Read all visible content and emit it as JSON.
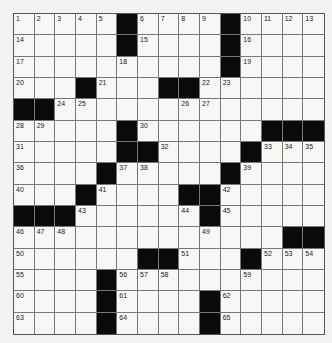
{
  "puzzle": {
    "rows": 15,
    "cols": 15,
    "grid": [
      "#####B######B####",
      ""
    ],
    "layout": [
      ".....#....#....",
      ".....#....#....",
      "..........#....",
      "...#...##......",
      "##.............",
      ".....#......###",
      ".....##....#...",
      "....#.....#....",
      "...#....##.....",
      "###......#.....",
      ".............##",
      "......##...#...",
      "....#..........",
      "....#....#.....",
      "....#....#....."
    ],
    "numbers": [
      [
        1,
        2,
        3,
        4,
        5,
        0,
        6,
        7,
        8,
        9,
        0,
        10,
        11,
        12,
        13
      ],
      [
        14,
        0,
        0,
        0,
        0,
        0,
        15,
        0,
        0,
        0,
        0,
        16,
        0,
        0,
        0
      ],
      [
        17,
        0,
        0,
        0,
        0,
        18,
        0,
        0,
        0,
        0,
        0,
        19,
        0,
        0,
        0
      ],
      [
        20,
        0,
        0,
        0,
        21,
        0,
        0,
        0,
        0,
        22,
        23,
        0,
        0,
        0,
        0
      ],
      [
        0,
        0,
        24,
        25,
        0,
        0,
        0,
        0,
        26,
        27,
        0,
        0,
        0,
        0,
        0
      ],
      [
        28,
        29,
        0,
        0,
        0,
        0,
        30,
        0,
        0,
        0,
        0,
        0,
        0,
        0,
        0
      ],
      [
        31,
        0,
        0,
        0,
        0,
        0,
        0,
        32,
        0,
        0,
        0,
        0,
        33,
        34,
        35
      ],
      [
        36,
        0,
        0,
        0,
        0,
        37,
        38,
        0,
        0,
        0,
        0,
        39,
        0,
        0,
        0
      ],
      [
        40,
        0,
        0,
        0,
        41,
        0,
        0,
        0,
        0,
        0,
        42,
        0,
        0,
        0,
        0
      ],
      [
        0,
        0,
        0,
        43,
        0,
        0,
        0,
        0,
        44,
        0,
        45,
        0,
        0,
        0,
        0
      ],
      [
        46,
        47,
        48,
        0,
        0,
        0,
        0,
        0,
        0,
        49,
        0,
        0,
        0,
        0,
        0
      ],
      [
        50,
        0,
        0,
        0,
        0,
        0,
        0,
        0,
        51,
        0,
        0,
        0,
        52,
        53,
        54
      ],
      [
        55,
        0,
        0,
        0,
        0,
        56,
        57,
        58,
        0,
        0,
        0,
        59,
        0,
        0,
        0
      ],
      [
        60,
        0,
        0,
        0,
        0,
        61,
        0,
        0,
        0,
        0,
        62,
        0,
        0,
        0,
        0
      ],
      [
        63,
        0,
        0,
        0,
        0,
        64,
        0,
        0,
        0,
        0,
        65,
        0,
        0,
        0,
        0
      ]
    ]
  }
}
